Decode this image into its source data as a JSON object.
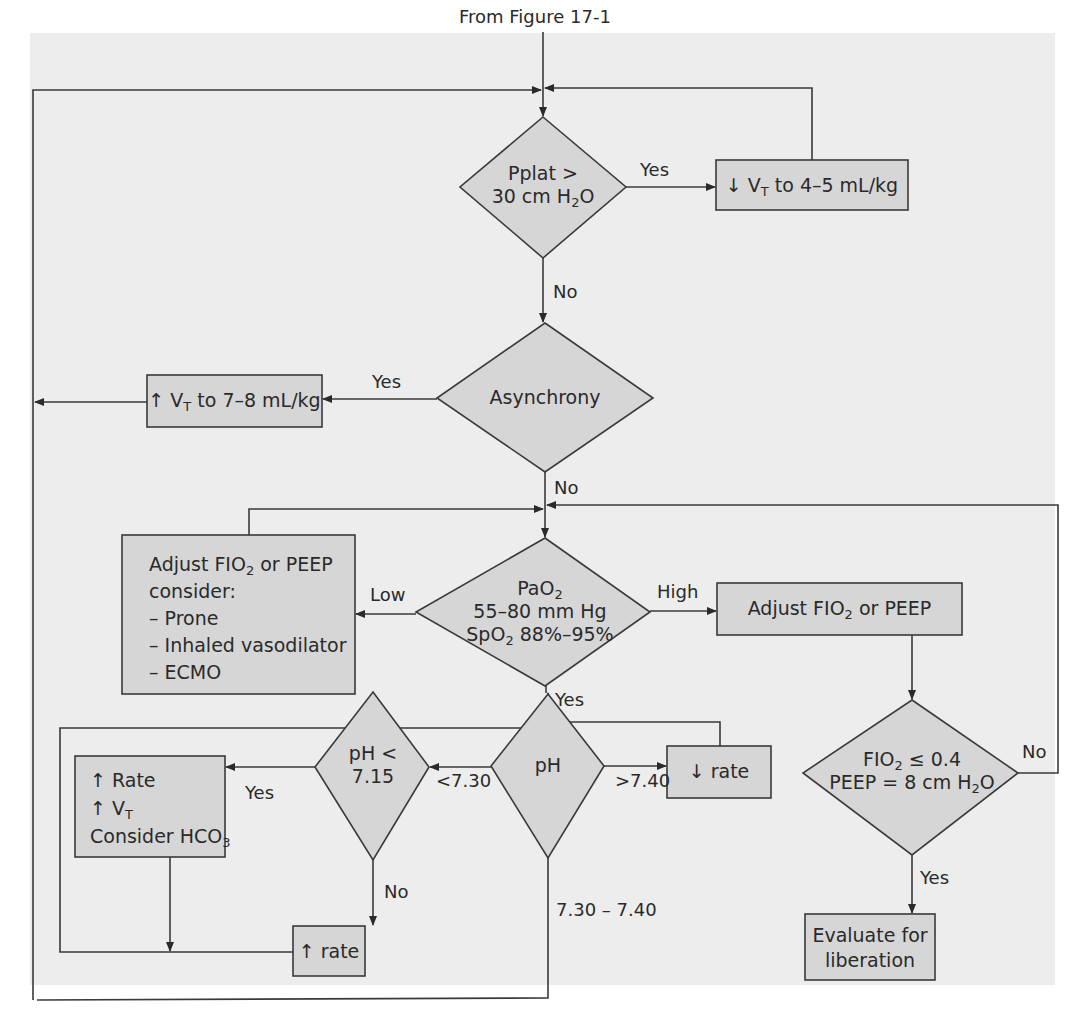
{
  "figure": {
    "source_label": "From Figure 17-1",
    "colors": {
      "page_background": "#ededed",
      "node_fill": "#d6d6d6",
      "stroke": "#3a3a3a",
      "text": "#2a2a2a"
    }
  },
  "nodes": {
    "pplat": {
      "type": "decision",
      "line1": "Pplat >",
      "line2_pre": "30 cm H",
      "line2_sub": "2",
      "line2_post": "O"
    },
    "decrease_vt": {
      "type": "process",
      "arrow": "↓",
      "pre": " V",
      "sub": "T",
      "post": " to 4–5 mL/kg"
    },
    "asynchrony": {
      "type": "decision",
      "text": "Asynchrony"
    },
    "increase_vt": {
      "type": "process",
      "arrow": "↑",
      "pre": " V",
      "sub": "T",
      "post": " to 7–8 mL/kg"
    },
    "pao2": {
      "type": "decision",
      "line1_pre": "PaO",
      "line1_sub": "2",
      "line2": "55–80 mm Hg",
      "line3_pre": "SpO",
      "line3_sub": "2",
      "line3_post": " 88%–95%"
    },
    "low_action": {
      "type": "process",
      "line1_pre": "Adjust FIO",
      "line1_sub": "2",
      "line1_post": " or PEEP",
      "line2": "consider:",
      "items": [
        "– Prone",
        "– Inhaled vasodilator",
        "– ECMO"
      ]
    },
    "high_action": {
      "type": "process",
      "pre": "Adjust FIO",
      "sub": "2",
      "post": " or PEEP"
    },
    "fio2_check": {
      "type": "decision",
      "line1_pre": "FIO",
      "line1_sub": "2",
      "line1_post": " ≤ 0.4",
      "line2_pre": "PEEP = 8 cm H",
      "line2_sub": "2",
      "line2_post": "O"
    },
    "evaluate": {
      "type": "terminal",
      "line1": "Evaluate for",
      "line2": "liberation"
    },
    "ph": {
      "type": "decision",
      "text": "pH"
    },
    "decrease_rate": {
      "type": "process",
      "arrow": "↓",
      "text": " rate"
    },
    "ph_low": {
      "type": "decision",
      "line1": "pH <",
      "line2": "7.15"
    },
    "acidosis_action": {
      "type": "process",
      "line1_arrow": "↑",
      "line1": " Rate",
      "line2_arrow": "↑",
      "line2_pre": " V",
      "line2_sub": "T",
      "line3_pre": "Consider HCO",
      "line3_sub": "3"
    },
    "increase_rate": {
      "type": "process",
      "arrow": "↑",
      "text": " rate"
    }
  },
  "edges": {
    "pplat_yes": "Yes",
    "pplat_no": "No",
    "asynchrony_yes": "Yes",
    "asynchrony_no": "No",
    "pao2_low": "Low",
    "pao2_high": "High",
    "pao2_yes": "Yes",
    "fio2_no": "No",
    "fio2_yes": "Yes",
    "ph_low": "<7.30",
    "ph_high": ">7.40",
    "ph_normal": "7.30 – 7.40",
    "ph_low_yes": "Yes",
    "ph_low_no": "No"
  }
}
